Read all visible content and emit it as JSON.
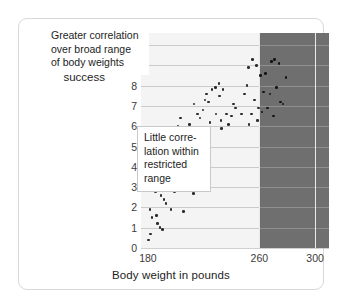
{
  "figure": {
    "y_axis_label": "Football linemen's\nsuccess",
    "x_axis_label": "Body weight in pounds"
  },
  "annotations": {
    "broad": "Greater correlation\nover broad range\nof body weights",
    "restricted": "Little corre-\nlation within\nrestricted\nrange"
  },
  "colors": {
    "shaded_region": "#6f6f6f",
    "plot_background": "#f4f4f4",
    "dot": "#2b2b2b",
    "gridline": "#aaaaaa",
    "frame": "#d8d8d8"
  },
  "chart_data": {
    "type": "scatter",
    "title": "",
    "xlabel": "Body weight in pounds",
    "ylabel": "Football linemen's success",
    "xlim": [
      175,
      310
    ],
    "ylim": [
      0,
      10.6
    ],
    "xticks": [
      180,
      260,
      300
    ],
    "ytick_labels": [
      "0",
      "1",
      "2",
      "3",
      "4",
      "5",
      "6",
      "7",
      "8",
      "9",
      "10"
    ],
    "yticks": [
      0,
      1,
      2,
      3,
      4,
      5,
      6,
      7,
      8,
      9,
      10
    ],
    "grid": "horizontal-gridlines-plus-vertical-at-260-and-300",
    "legend": "none",
    "shaded_region": {
      "x_start": 260,
      "x_end": 310,
      "label": "restricted range"
    },
    "annotations": [
      {
        "text": "Greater correlation over broad range of body weights",
        "region": "full-range"
      },
      {
        "text": "Little correlation within restricted range",
        "region": "restricted-range"
      }
    ],
    "points": [
      [
        180.5,
        0.4
      ],
      [
        182.0,
        0.7
      ],
      [
        181.5,
        1.9
      ],
      [
        183.0,
        1.5
      ],
      [
        187.0,
        1.2
      ],
      [
        188.5,
        1.0
      ],
      [
        190.5,
        0.9
      ],
      [
        186.0,
        1.6
      ],
      [
        181.0,
        2.9
      ],
      [
        184.0,
        3.4
      ],
      [
        185.5,
        2.8
      ],
      [
        182.5,
        3.8
      ],
      [
        189.5,
        2.6
      ],
      [
        191.5,
        2.4
      ],
      [
        195.5,
        3.3
      ],
      [
        193.0,
        2.2
      ],
      [
        196.5,
        1.9
      ],
      [
        205.5,
        1.8
      ],
      [
        203.0,
        3.2
      ],
      [
        207.5,
        2.9
      ],
      [
        212.5,
        2.7
      ],
      [
        199.0,
        2.8
      ],
      [
        183.5,
        4.4
      ],
      [
        189.0,
        4.5
      ],
      [
        191.0,
        4.4
      ],
      [
        187.5,
        4.8
      ],
      [
        194.5,
        3.7
      ],
      [
        197.5,
        3.9
      ],
      [
        204.5,
        4.4
      ],
      [
        206.5,
        3.9
      ],
      [
        202.0,
        4.3
      ],
      [
        192.5,
        5.2
      ],
      [
        195.0,
        5.3
      ],
      [
        198.5,
        5.3
      ],
      [
        200.5,
        4.9
      ],
      [
        209.5,
        5.4
      ],
      [
        211.5,
        5.5
      ],
      [
        214.5,
        5.0
      ],
      [
        216.5,
        5.5
      ],
      [
        207.0,
        5.6
      ],
      [
        201.5,
        6.0
      ],
      [
        203.5,
        6.4
      ],
      [
        205.0,
        5.7
      ],
      [
        210.0,
        6.1
      ],
      [
        213.0,
        7.1
      ],
      [
        217.5,
        6.4
      ],
      [
        219.5,
        6.8
      ],
      [
        221.0,
        7.3
      ],
      [
        223.5,
        7.2
      ],
      [
        215.5,
        6.6
      ],
      [
        222.0,
        7.6
      ],
      [
        226.0,
        7.8
      ],
      [
        228.5,
        7.9
      ],
      [
        231.0,
        8.1
      ],
      [
        220.0,
        5.8
      ],
      [
        224.5,
        6.2
      ],
      [
        229.0,
        6.6
      ],
      [
        231.5,
        7.5
      ],
      [
        232.5,
        6.3
      ],
      [
        233.0,
        5.9
      ],
      [
        234.0,
        7.8
      ],
      [
        236.5,
        6.6
      ],
      [
        238.0,
        6.1
      ],
      [
        240.0,
        6.5
      ],
      [
        241.5,
        7.1
      ],
      [
        243.0,
        6.9
      ],
      [
        247.0,
        6.6
      ],
      [
        249.5,
        7.6
      ],
      [
        252.0,
        8.9
      ],
      [
        255.0,
        9.3
      ],
      [
        258.0,
        9.0
      ],
      [
        261.0,
        8.5
      ],
      [
        264.5,
        8.6
      ],
      [
        268.5,
        9.2
      ],
      [
        271.0,
        9.3
      ],
      [
        274.0,
        9.1
      ],
      [
        279.0,
        8.4
      ],
      [
        263.0,
        7.7
      ],
      [
        267.5,
        7.6
      ],
      [
        272.5,
        7.9
      ],
      [
        256.5,
        7.3
      ],
      [
        259.5,
        6.9
      ],
      [
        266.0,
        6.9
      ],
      [
        275.0,
        7.2
      ],
      [
        277.0,
        7.1
      ],
      [
        254.5,
        6.6
      ],
      [
        262.0,
        6.7
      ],
      [
        270.0,
        6.5
      ],
      [
        252.5,
        6.1
      ],
      [
        258.5,
        6.3
      ],
      [
        251.0,
        8.0
      ]
    ]
  }
}
